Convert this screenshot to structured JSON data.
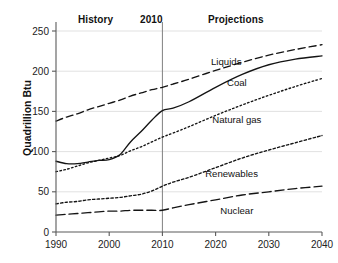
{
  "header": {
    "history_label": "History",
    "divider_year_label": "2010",
    "projections_label": "Projections"
  },
  "axis": {
    "ylabel": "Quadrillion Btu"
  },
  "chart_data": {
    "type": "line",
    "title": "",
    "subtitle": "",
    "xlabel": "",
    "ylabel": "Quadrillion Btu",
    "xlim": [
      1990,
      2040
    ],
    "ylim": [
      0,
      250
    ],
    "xticks": [
      1990,
      2000,
      2010,
      2020,
      2030,
      2040
    ],
    "yticks": [
      0,
      50,
      100,
      150,
      200,
      250
    ],
    "grid": "horizontal",
    "legend": "inline-annotations",
    "annotations": [
      {
        "text": "History",
        "x": 1998,
        "note": "region label above plot, left of 2010 divider"
      },
      {
        "text": "2010",
        "x": 2010,
        "note": "vertical divider separating history and projections"
      },
      {
        "text": "Projections",
        "x": 2026,
        "note": "region label above plot, right of 2010 divider"
      }
    ],
    "divider_x": 2010,
    "x": [
      1990,
      1992,
      1994,
      1996,
      1998,
      2000,
      2002,
      2004,
      2006,
      2008,
      2010,
      2012,
      2015,
      2020,
      2025,
      2030,
      2035,
      2040
    ],
    "series": [
      {
        "name": "Liquids",
        "style": "dashed",
        "label_x": 2022,
        "label_y": 208,
        "values": [
          138,
          143,
          147,
          152,
          156,
          160,
          164,
          169,
          173,
          177,
          180,
          184,
          190,
          201,
          211,
          220,
          227,
          233
        ]
      },
      {
        "name": "Coal",
        "style": "solid",
        "label_x": 2024,
        "label_y": 182,
        "values": [
          88,
          85,
          85,
          87,
          89,
          90,
          96,
          112,
          125,
          139,
          151,
          154,
          162,
          180,
          196,
          208,
          215,
          219
        ]
      },
      {
        "name": "Natural gas",
        "style": "dotted",
        "label_x": 2024,
        "label_y": 136,
        "values": [
          75,
          78,
          82,
          86,
          89,
          92,
          95,
          101,
          106,
          112,
          118,
          123,
          131,
          145,
          158,
          170,
          181,
          191
        ]
      },
      {
        "name": "Renewables",
        "style": "fine-dotted",
        "label_x": 2023,
        "label_y": 68,
        "values": [
          35,
          37,
          38,
          40,
          41,
          42,
          43,
          45,
          47,
          51,
          57,
          62,
          68,
          80,
          92,
          102,
          111,
          120
        ]
      },
      {
        "name": "Nuclear",
        "style": "dash-dot",
        "label_x": 2024,
        "label_y": 23,
        "values": [
          21,
          22,
          23,
          24,
          25,
          26,
          26,
          27,
          27,
          27,
          27,
          30,
          34,
          40,
          46,
          50,
          54,
          57
        ]
      }
    ]
  }
}
